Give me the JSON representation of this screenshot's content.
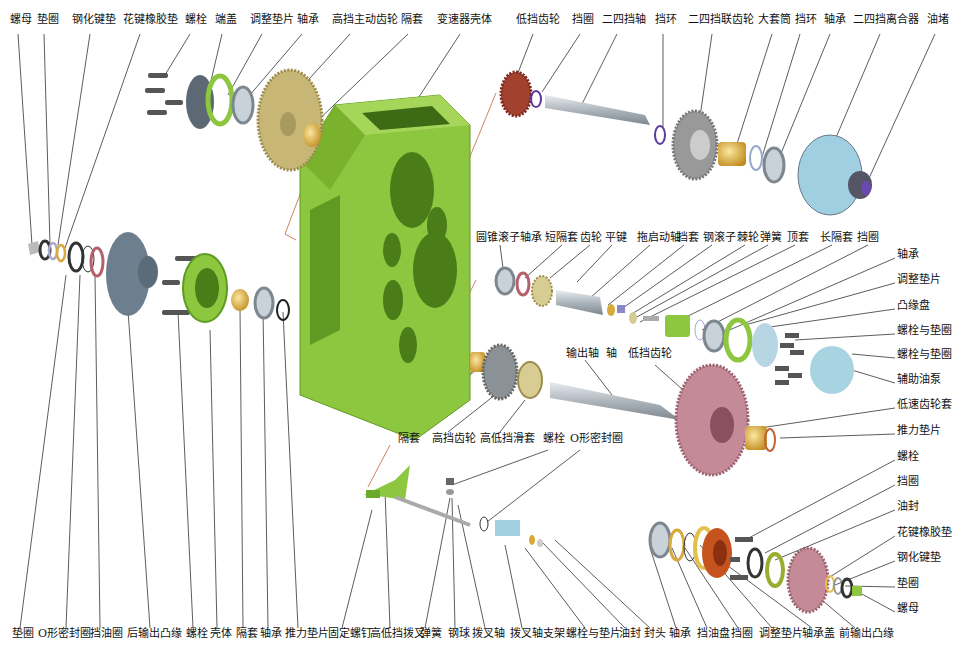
{
  "colors": {
    "housing": "#8dc63f",
    "housing_dark": "#5f9a22",
    "leader_line": "#333333",
    "red_leader": "#c0643a",
    "brass": "#d9a93a",
    "steel": "#b7bfc6",
    "low_gear_red": "#a3412f",
    "pink_gear": "#c58a97",
    "blue_grey": "#7d8e9d",
    "light_blue": "#9fcfe0"
  },
  "labels": {
    "top": [
      {
        "id": "t1",
        "text": "螺母",
        "x": 10,
        "y": 20
      },
      {
        "id": "t2",
        "text": "垫圈",
        "x": 37,
        "y": 20
      },
      {
        "id": "t3",
        "text": "钢化键垫",
        "x": 72,
        "y": 20
      },
      {
        "id": "t4",
        "text": "花键橡胶垫",
        "x": 123,
        "y": 20
      },
      {
        "id": "t5",
        "text": "螺栓",
        "x": 185,
        "y": 20
      },
      {
        "id": "t6",
        "text": "端盖",
        "x": 215,
        "y": 20
      },
      {
        "id": "t7",
        "text": "调整垫片",
        "x": 250,
        "y": 20
      },
      {
        "id": "t8",
        "text": "轴承",
        "x": 297,
        "y": 20
      },
      {
        "id": "t9",
        "text": "高挡主动齿轮",
        "x": 332,
        "y": 20
      },
      {
        "id": "t10",
        "text": "隔套",
        "x": 401,
        "y": 20
      },
      {
        "id": "t11",
        "text": "变速器壳体",
        "x": 437,
        "y": 20
      },
      {
        "id": "t12",
        "text": "低挡齿轮",
        "x": 516,
        "y": 20
      },
      {
        "id": "t13",
        "text": "挡圈",
        "x": 572,
        "y": 20
      },
      {
        "id": "t14",
        "text": "二四挡轴",
        "x": 602,
        "y": 20
      },
      {
        "id": "t15",
        "text": "挡环",
        "x": 655,
        "y": 20
      },
      {
        "id": "t16",
        "text": "二四挡联齿轮",
        "x": 688,
        "y": 20
      },
      {
        "id": "t17",
        "text": "大套筒",
        "x": 758,
        "y": 20
      },
      {
        "id": "t18",
        "text": "挡环",
        "x": 795,
        "y": 20
      },
      {
        "id": "t19",
        "text": "轴承",
        "x": 824,
        "y": 20
      },
      {
        "id": "t20",
        "text": "二四挡离合器",
        "x": 853,
        "y": 20
      },
      {
        "id": "t21",
        "text": "油堵",
        "x": 927,
        "y": 20
      }
    ],
    "middle_row": [
      {
        "id": "m1",
        "text": "圆锥滚子轴承",
        "x": 476,
        "y": 232
      },
      {
        "id": "m2",
        "text": "短隔套",
        "x": 545,
        "y": 232
      },
      {
        "id": "m3",
        "text": "齿轮",
        "x": 580,
        "y": 232
      },
      {
        "id": "m4",
        "text": "平键",
        "x": 605,
        "y": 232
      },
      {
        "id": "m5",
        "text": "拖启动轴",
        "x": 637,
        "y": 232
      },
      {
        "id": "m6",
        "text": "挡套",
        "x": 677,
        "y": 232
      },
      {
        "id": "m7",
        "text": "钢滚子",
        "x": 703,
        "y": 232
      },
      {
        "id": "m8",
        "text": "棘轮",
        "x": 737,
        "y": 232
      },
      {
        "id": "m9",
        "text": "弹簧",
        "x": 760,
        "y": 232
      },
      {
        "id": "m10",
        "text": "顶套",
        "x": 787,
        "y": 232
      },
      {
        "id": "m11",
        "text": "长隔套",
        "x": 820,
        "y": 232
      },
      {
        "id": "m12",
        "text": "挡圈",
        "x": 857,
        "y": 232
      }
    ],
    "right_column": [
      {
        "id": "r1",
        "text": "轴承",
        "x": 897,
        "y": 253
      },
      {
        "id": "r2",
        "text": "调整垫片",
        "x": 897,
        "y": 278
      },
      {
        "id": "r3",
        "text": "凸缘盘",
        "x": 897,
        "y": 304
      },
      {
        "id": "r4",
        "text": "螺栓与垫圈",
        "x": 897,
        "y": 329
      },
      {
        "id": "r5",
        "text": "螺栓与垫圈",
        "x": 897,
        "y": 353
      },
      {
        "id": "r6",
        "text": "辅助油泵",
        "x": 897,
        "y": 378
      },
      {
        "id": "r7",
        "text": "低速齿轮套",
        "x": 897,
        "y": 403
      },
      {
        "id": "r8",
        "text": "推力垫片",
        "x": 897,
        "y": 429
      },
      {
        "id": "r9",
        "text": "螺栓",
        "x": 897,
        "y": 455
      },
      {
        "id": "r10",
        "text": "挡圈",
        "x": 897,
        "y": 480
      },
      {
        "id": "r11",
        "text": "油封",
        "x": 897,
        "y": 505
      },
      {
        "id": "r12",
        "text": "花键橡胶垫",
        "x": 897,
        "y": 531
      },
      {
        "id": "r13",
        "text": "钢化键垫",
        "x": 897,
        "y": 556
      },
      {
        "id": "r14",
        "text": "垫圈",
        "x": 897,
        "y": 582
      },
      {
        "id": "r15",
        "text": "螺母",
        "x": 897,
        "y": 607
      }
    ],
    "inner": [
      {
        "id": "i1",
        "text": "输出轴",
        "x": 566,
        "y": 352
      },
      {
        "id": "i2",
        "text": "轴",
        "x": 606,
        "y": 352
      },
      {
        "id": "i3",
        "text": "低挡齿轮",
        "x": 628,
        "y": 352
      },
      {
        "id": "i4",
        "text": "隔套",
        "x": 398,
        "y": 437
      },
      {
        "id": "i5",
        "text": "高挡齿轮",
        "x": 432,
        "y": 437
      },
      {
        "id": "i6",
        "text": "高低挡滑套",
        "x": 480,
        "y": 437
      },
      {
        "id": "i7",
        "text": "螺栓",
        "x": 543,
        "y": 437
      },
      {
        "id": "i8",
        "text": "O形密封圈",
        "x": 570,
        "y": 437
      }
    ],
    "bottom": [
      {
        "id": "b1",
        "text": "垫圈",
        "x": 12,
        "y": 632
      },
      {
        "id": "b2",
        "text": "O形密封圈",
        "x": 38,
        "y": 632
      },
      {
        "id": "b3",
        "text": "挡油圈",
        "x": 90,
        "y": 632
      },
      {
        "id": "b4",
        "text": "后输出凸缘",
        "x": 127,
        "y": 632
      },
      {
        "id": "b5",
        "text": "螺栓",
        "x": 186,
        "y": 632
      },
      {
        "id": "b6",
        "text": "壳体",
        "x": 210,
        "y": 632
      },
      {
        "id": "b7",
        "text": "隔套",
        "x": 236,
        "y": 632
      },
      {
        "id": "b8",
        "text": "轴承",
        "x": 260,
        "y": 632
      },
      {
        "id": "b9",
        "text": "推力垫片",
        "x": 285,
        "y": 632
      },
      {
        "id": "b10",
        "text": "固定螺钉",
        "x": 328,
        "y": 632
      },
      {
        "id": "b11",
        "text": "高低挡拨叉",
        "x": 370,
        "y": 632
      },
      {
        "id": "b12",
        "text": "弹簧",
        "x": 420,
        "y": 632
      },
      {
        "id": "b13",
        "text": "钢球",
        "x": 448,
        "y": 632
      },
      {
        "id": "b14",
        "text": "拨叉轴",
        "x": 472,
        "y": 632
      },
      {
        "id": "b15",
        "text": "拨叉轴支架",
        "x": 510,
        "y": 632
      },
      {
        "id": "b16",
        "text": "螺栓与垫片",
        "x": 566,
        "y": 632
      },
      {
        "id": "b17",
        "text": "油封",
        "x": 619,
        "y": 632
      },
      {
        "id": "b18",
        "text": "封头",
        "x": 644,
        "y": 632
      },
      {
        "id": "b19",
        "text": "轴承",
        "x": 669,
        "y": 632
      },
      {
        "id": "b20",
        "text": "挡油盘",
        "x": 697,
        "y": 632
      },
      {
        "id": "b21",
        "text": "挡圈",
        "x": 731,
        "y": 632
      },
      {
        "id": "b22",
        "text": "调整垫片",
        "x": 759,
        "y": 632
      },
      {
        "id": "b23",
        "text": "轴承盖",
        "x": 802,
        "y": 632
      },
      {
        "id": "b24",
        "text": "前输出凸缘",
        "x": 839,
        "y": 632
      }
    ]
  }
}
